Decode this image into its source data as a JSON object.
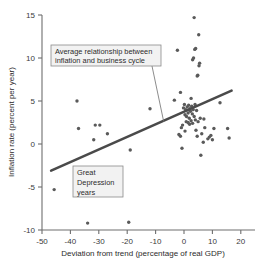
{
  "chart_data": {
    "type": "scatter",
    "title": "",
    "xlabel": "Deviation from trend (percentage of real GDP)",
    "ylabel": "Inflation rate (percent per year)",
    "xlim": [
      -50,
      20
    ],
    "ylim": [
      -10,
      15
    ],
    "xticks": [
      -50,
      -40,
      -30,
      -20,
      -10,
      0,
      10,
      20
    ],
    "xtick_labels": [
      "-50",
      "-40",
      "-30",
      "-20",
      "-10",
      "0",
      "10",
      "20"
    ],
    "yticks": [
      -10,
      -5,
      0,
      5,
      10,
      15
    ],
    "ytick_labels": [
      "-10",
      "-5",
      "0",
      "5",
      "10",
      "15"
    ],
    "grid": false,
    "legend": "none",
    "series": [
      {
        "name": "Inflation rate vs deviation from trend",
        "marker": "circle",
        "color": "#5a5a5a",
        "points": [
          [
            -46.0,
            -5.3
          ],
          [
            -38.5,
            5.0
          ],
          [
            -38.0,
            1.8
          ],
          [
            -35.0,
            -9.2
          ],
          [
            -33.0,
            0.5
          ],
          [
            -32.5,
            2.2
          ],
          [
            -31.0,
            2.2
          ],
          [
            -28.5,
            1.2
          ],
          [
            -21.5,
            -9.1
          ],
          [
            -21.0,
            -0.7
          ],
          [
            -14.5,
            4.1
          ],
          [
            -6.5,
            5.1
          ],
          [
            -5.5,
            10.9
          ],
          [
            -5.0,
            1.1
          ],
          [
            -4.5,
            6.0
          ],
          [
            -4.5,
            0.9
          ],
          [
            -4.2,
            1.9
          ],
          [
            -4.0,
            -0.5
          ],
          [
            -3.8,
            2.2
          ],
          [
            -3.5,
            4.2
          ],
          [
            -3.2,
            4.6
          ],
          [
            -3.0,
            3.4
          ],
          [
            -3.0,
            1.5
          ],
          [
            -2.8,
            4.0
          ],
          [
            -2.6,
            2.6
          ],
          [
            -2.5,
            3.2
          ],
          [
            -2.3,
            4.3
          ],
          [
            -2.0,
            3.6
          ],
          [
            -2.0,
            2.5
          ],
          [
            -1.8,
            4.5
          ],
          [
            -1.6,
            3.0
          ],
          [
            -1.5,
            2.3
          ],
          [
            -1.4,
            4.1
          ],
          [
            -1.2,
            3.8
          ],
          [
            -1.0,
            5.3
          ],
          [
            -1.0,
            2.7
          ],
          [
            -0.8,
            4.4
          ],
          [
            -0.6,
            3.5
          ],
          [
            -0.5,
            9.8
          ],
          [
            -0.5,
            2.4
          ],
          [
            -0.3,
            4.0
          ],
          [
            -0.2,
            10.0
          ],
          [
            0.0,
            14.7
          ],
          [
            0.0,
            3.2
          ],
          [
            0.2,
            11.0
          ],
          [
            0.3,
            4.6
          ],
          [
            0.4,
            2.8
          ],
          [
            0.5,
            11.1
          ],
          [
            0.6,
            1.6
          ],
          [
            0.8,
            3.9
          ],
          [
            1.0,
            7.9
          ],
          [
            1.0,
            0.9
          ],
          [
            1.2,
            8.0
          ],
          [
            1.3,
            2.6
          ],
          [
            1.5,
            12.7
          ],
          [
            1.6,
            9.1
          ],
          [
            1.8,
            9.4
          ],
          [
            2.0,
            3.0
          ],
          [
            2.2,
            -1.3
          ],
          [
            2.5,
            1.2
          ],
          [
            3.0,
            0.2
          ],
          [
            3.2,
            2.9
          ],
          [
            3.5,
            1.9
          ],
          [
            4.5,
            0.6
          ],
          [
            5.0,
            0.8
          ],
          [
            5.5,
            1.0
          ],
          [
            6.0,
            0.5
          ],
          [
            6.5,
            1.8
          ],
          [
            8.5,
            4.8
          ],
          [
            11.0,
            1.8
          ],
          [
            11.5,
            0.7
          ]
        ]
      }
    ],
    "trend_line": {
      "label": "Average relationship between inflation and business cycle",
      "x_start": -47.0,
      "y_start": -3.1,
      "x_end": 12.3,
      "y_end": 6.2,
      "color": "#4a4a4a"
    },
    "annotations": [
      {
        "id": "trend-callout",
        "text_lines": [
          "Average relationship between",
          "inflation and business cycle"
        ],
        "points_to": [
          -10.0,
          2.6
        ]
      },
      {
        "id": "depression-callout",
        "text_lines": [
          "Great",
          "Depression",
          "years"
        ]
      }
    ]
  }
}
